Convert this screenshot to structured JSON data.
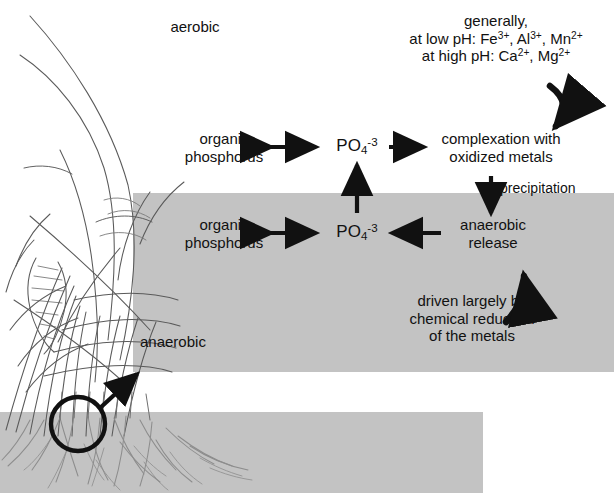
{
  "figure": {
    "colors": {
      "band_gray": "#c3c3c3",
      "ink": "#111111",
      "plant_line": "#555555"
    }
  },
  "zones": {
    "aerobic_label": "aerobic",
    "anaerobic_label": "anaerobic"
  },
  "metals_note": {
    "line1": "generally,",
    "line2_prefix": "at low pH: Fe",
    "line2_sup1": "3+",
    "line2_mid1": ", Al",
    "line2_sup2": "3+",
    "line2_mid2": ", Mn",
    "line2_sup3": "2+",
    "line3_prefix": "at high pH: Ca",
    "line3_sup1": "2+",
    "line3_mid1": ", Mg",
    "line3_sup2": "2+"
  },
  "aerobic_row": {
    "organic_line1": "organic",
    "organic_line2": "phosphorus",
    "phosphate_base": "PO",
    "phosphate_sub": "4",
    "phosphate_sup": "-3",
    "complexation_line1": "complexation with",
    "complexation_line2": "oxidized metals"
  },
  "anaerobic_row": {
    "organic_line1": "organic",
    "organic_line2": "phosphorus",
    "phosphate_base": "PO",
    "phosphate_sub": "4",
    "phosphate_sup": "-3",
    "release_line1": "anaerobic",
    "release_line2": "release"
  },
  "labels": {
    "precipitation": "precipitation"
  },
  "reduction_note": {
    "line1": "driven largely by",
    "line2": "chemical reduction",
    "line3": "of the metals"
  },
  "icons": {
    "magnifier": "magnifier-circle-icon",
    "callout_arrow": "callout-arrow-icon",
    "curved_arrow_top": "curved-arrow-down-icon",
    "curved_arrow_bottom": "curved-arrow-up-icon",
    "double_arrow": "double-headed-arrow-icon",
    "right_arrow": "right-arrow-icon",
    "left_arrow": "left-arrow-icon",
    "up_arrow": "up-arrow-icon",
    "down_arrow": "down-arrow-icon",
    "plant": "wetland-plant-illustration",
    "roots": "root-system-illustration"
  }
}
